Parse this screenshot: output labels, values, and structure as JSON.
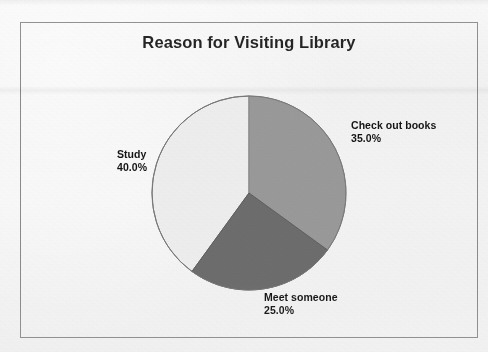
{
  "chart_data": {
    "type": "pie",
    "title": "Reason for Visiting Library",
    "xlabel": "",
    "ylabel": "",
    "legend": "none",
    "grid": false,
    "start_angle_deg": 90,
    "direction": "clockwise",
    "categories": [
      "Check out books",
      "Meet someone",
      "Study"
    ],
    "values": [
      35.0,
      25.0,
      40.0
    ],
    "labels": [
      "35.0%",
      "25.0%",
      "40.0%"
    ],
    "colors": [
      "#9b9b9b",
      "#6e6e6e",
      "#f0f0f0"
    ],
    "slices": [
      {
        "name": "Check out books",
        "value": 35.0,
        "label": "35.0%",
        "color": "#9b9b9b",
        "start_deg": 0,
        "end_deg": 126
      },
      {
        "name": "Meet someone",
        "value": 25.0,
        "label": "25.0%",
        "color": "#6e6e6e",
        "start_deg": 126,
        "end_deg": 216
      },
      {
        "name": "Study",
        "value": 40.0,
        "label": "40.0%",
        "color": "#f0f0f0",
        "start_deg": 216,
        "end_deg": 360
      }
    ]
  },
  "figure": {
    "title": "Reason for Visiting Library",
    "border_color": "#8c8c8c",
    "background_color": "#f4f4f4",
    "outline_color": "#777777"
  },
  "labels": {
    "checkout": {
      "name": "Check out books",
      "pct": "35.0%"
    },
    "meet": {
      "name": "Meet someone",
      "pct": "25.0%"
    },
    "study": {
      "name": "Study",
      "pct": "40.0%"
    }
  }
}
